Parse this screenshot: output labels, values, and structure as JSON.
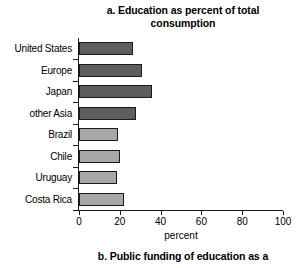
{
  "chart_data": {
    "type": "bar",
    "orientation": "horizontal",
    "title": "a. Education as percent of total consumption",
    "title_lines": [
      "a. Education as percent of total",
      "consumption"
    ],
    "xlabel": "percent",
    "ylabel": "",
    "xlim": [
      0,
      100
    ],
    "xticks": [
      0,
      20,
      40,
      60,
      80,
      100
    ],
    "xticklabels": [
      "0",
      "20",
      "40",
      "60",
      "80",
      "100"
    ],
    "grid": false,
    "legend": false,
    "categories": [
      "United States",
      "Europe",
      "Japan",
      "other Asia",
      "Brazil",
      "Chile",
      "Uruguay",
      "Costa Rica"
    ],
    "values": [
      26.5,
      31.0,
      36.0,
      28.0,
      19.0,
      20.0,
      18.5,
      22.0
    ],
    "bar_colors": [
      "#5e5e5e",
      "#5e5e5e",
      "#5e5e5e",
      "#5e5e5e",
      "#a8a8a8",
      "#a8a8a8",
      "#a8a8a8",
      "#a8a8a8"
    ],
    "bar_edge_color": "#1a1a1a"
  },
  "next_chart": {
    "title_partial": "b. Public funding of education as a"
  },
  "colors": {
    "background": "#ffffff",
    "text": "#000000",
    "axis": "#1a1a1a",
    "bar_dark": "#5e5e5e",
    "bar_light": "#a8a8a8"
  }
}
